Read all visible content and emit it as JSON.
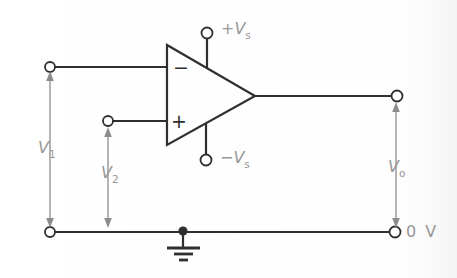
{
  "diagram": {
    "labels": {
      "input1": {
        "base": "V",
        "sub": "1"
      },
      "input2": {
        "base": "V",
        "sub": "2"
      },
      "output": {
        "base": "V",
        "sub": "o"
      },
      "supply_pos": {
        "prefix": "+",
        "base": "V",
        "sub": "s"
      },
      "supply_neg": {
        "prefix": "−",
        "base": "V",
        "sub": "s"
      },
      "ground_ref": "0 V",
      "inverting_input": "−",
      "noninverting_input": "+"
    },
    "colors": {
      "wire": "#2f2f2f",
      "label": "#979797",
      "arrow": "#8c8c8c",
      "background": "#fdfdfd"
    }
  }
}
